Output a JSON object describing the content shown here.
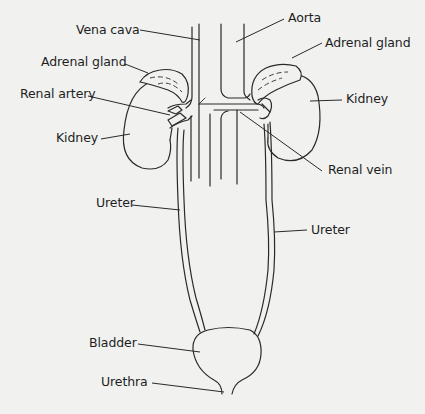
{
  "diagram": {
    "background_color": "#f1f1f0",
    "line_color": "#2a2a2a",
    "labels": {
      "vena_cava": "Vena cava",
      "aorta": "Aorta",
      "adrenal_gland_left": "Adrenal gland",
      "adrenal_gland_right": "Adrenal gland",
      "renal_artery": "Renal artery",
      "kidney_left": "Kidney",
      "kidney_right": "Kidney",
      "renal_vein": "Renal vein",
      "ureter_left": "Ureter",
      "ureter_right": "Ureter",
      "bladder": "Bladder",
      "urethra": "Urethra"
    }
  }
}
